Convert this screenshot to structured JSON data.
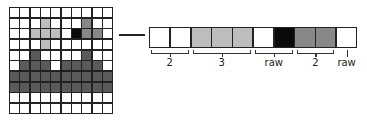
{
  "colors": {
    "W": "#ffffff",
    "L": "#bdbdbd",
    "M": "#888888",
    "B": "#0a0a0a",
    "D": "#5a5a5a"
  },
  "grid": {
    "rows": 10,
    "cols": 10,
    "cells": [
      "WWWWWWWWWW",
      "WWWLWWWMWW",
      "WWLLLWBMMW",
      "WWWLWWWWWW",
      "WWDWWWWDWW",
      "WDDDWDDDDW",
      "DDDDDDDDDD",
      "DDDDDDDDDD",
      "WWWWWWWWWW",
      "WWWWWWWWWW"
    ]
  },
  "strip": {
    "source_row": 2,
    "cells": [
      "W",
      "W",
      "L",
      "L",
      "L",
      "W",
      "B",
      "M",
      "M",
      "W"
    ]
  },
  "annotations": [
    {
      "label": "2",
      "start": 0,
      "end": 1,
      "type": "bracket"
    },
    {
      "label": "3",
      "start": 2,
      "end": 4,
      "type": "bracket"
    },
    {
      "label": "raw",
      "start": 5,
      "end": 6,
      "type": "bracket"
    },
    {
      "label": "2",
      "start": 7,
      "end": 8,
      "type": "bracket"
    },
    {
      "label": "raw",
      "start": 9,
      "end": 9,
      "type": "tick"
    }
  ]
}
